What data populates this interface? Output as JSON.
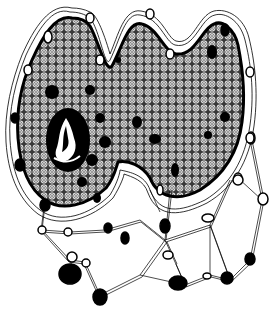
{
  "image": {
    "description": "Black and white pen-and-ink illustration of a lobed cellular mass filled with small concentric circles, dotted with solid black nuclei, a flame-like motif on the left, surrounded by a membrane of chained oval nodes that extends downward into a web/network of linked nodes.",
    "colors": {
      "ink": "#000000",
      "paper": "#ffffff",
      "texture": "#555555"
    },
    "elements": {
      "mass_outline": "lobed body",
      "texture": "concentric-circle pattern",
      "flame_motif": "white flame inside black oval",
      "nuclei_count_approx": 22,
      "network_nodes_approx": 30
    }
  }
}
